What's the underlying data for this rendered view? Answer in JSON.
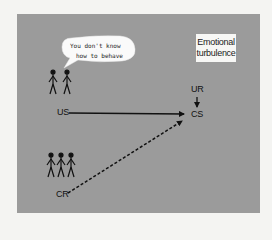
{
  "diagram": {
    "background_color": "#9b9b9b",
    "page_color": "#f4f4f2",
    "speech_bubble": {
      "line1": "You don't know",
      "line2": "how to behave"
    },
    "result_box": {
      "line1": "Emotional",
      "line2": "turbulence"
    },
    "nodes": {
      "us": "US",
      "ur": "UR",
      "cs": "CS",
      "cr": "CR"
    },
    "figures": {
      "top_group_count": 2,
      "bottom_group_count": 3
    },
    "edges": [
      {
        "from": "US",
        "to": "CS",
        "style": "solid"
      },
      {
        "from": "UR",
        "to": "CS",
        "style": "solid"
      },
      {
        "from": "CR",
        "to": "CS",
        "style": "dashed"
      }
    ]
  }
}
